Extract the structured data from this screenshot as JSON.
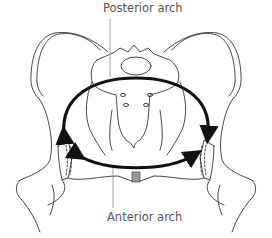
{
  "diagram": {
    "labels": {
      "posterior": "Posterior arch",
      "anterior": "Anterior arch"
    },
    "colors": {
      "outline": "#333333",
      "arrow": "#111111",
      "label_text": "#555555",
      "leader_line": "#888888",
      "symphysis_fill": "#999999"
    }
  }
}
